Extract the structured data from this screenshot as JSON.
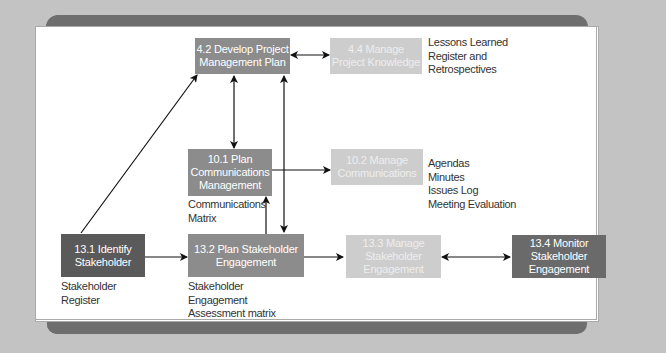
{
  "diagram": {
    "nodes": [
      {
        "id": "4.2",
        "label_line1": "4.2 Develop Project",
        "label_line2": "Management Plan",
        "shade": "mid"
      },
      {
        "id": "4.4",
        "label_line1": "4.4 Manage",
        "label_line2": "Project Knowledge",
        "shade": "light"
      },
      {
        "id": "10.1",
        "label_line1": "10.1 Plan",
        "label_line2": "Communications",
        "label_line3": "Management",
        "shade": "mid"
      },
      {
        "id": "10.2",
        "label_line1": "10.2 Manage",
        "label_line2": "Communications",
        "shade": "light"
      },
      {
        "id": "13.1",
        "label_line1": "13.1 Identify",
        "label_line2": "Stakeholder",
        "shade": "dark"
      },
      {
        "id": "13.2",
        "label_line1": "13.2 Plan Stakeholder",
        "label_line2": "Engagement",
        "shade": "mid"
      },
      {
        "id": "13.3",
        "label_line1": "13.3 Manage",
        "label_line2": "Stakeholder",
        "label_line3": "Engagement",
        "shade": "light"
      },
      {
        "id": "13.4",
        "label_line1": "13.4 Monitor",
        "label_line2": "Stakeholder",
        "label_line3": "Engagement",
        "shade": "dark"
      }
    ],
    "outputs": {
      "knowledge": [
        "Lessons Learned",
        "Register and",
        "Retrospectives"
      ],
      "manage_comms": [
        "Agendas",
        "Minutes",
        "Issues Log",
        "Meeting Evaluation"
      ],
      "plan_comms": [
        "Communications",
        "Matrix"
      ],
      "identify": [
        "Stakeholder",
        "Register"
      ],
      "plan_stakeholder": [
        "Stakeholder",
        "Engagement",
        "Assessment matrix"
      ]
    },
    "edges": [
      {
        "from": "13.1",
        "to": "4.2",
        "type": "single"
      },
      {
        "from": "4.2",
        "to": "4.4",
        "type": "double"
      },
      {
        "from": "4.2",
        "to": "10.1",
        "type": "double"
      },
      {
        "from": "4.2",
        "to": "13.2",
        "type": "double"
      },
      {
        "from": "10.1",
        "to": "10.2",
        "type": "single"
      },
      {
        "from": "13.2",
        "to": "10.1",
        "type": "single"
      },
      {
        "from": "13.1",
        "to": "13.2",
        "type": "single"
      },
      {
        "from": "13.2",
        "to": "13.3",
        "type": "single"
      },
      {
        "from": "13.3",
        "to": "13.4",
        "type": "double"
      }
    ],
    "colors": {
      "dark": "#5a5a5a",
      "mid": "#8c8c8c",
      "light": "#cdcdcd",
      "frame": "#6e6e6e",
      "background": "#c3c3c3"
    }
  }
}
